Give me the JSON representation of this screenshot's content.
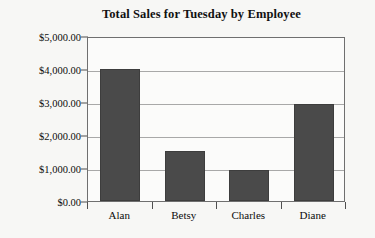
{
  "chart_data": {
    "type": "bar",
    "title": "Total Sales for Tuesday by Employee",
    "xlabel": "",
    "ylabel": "",
    "categories": [
      "Alan",
      "Betsy",
      "Charles",
      "Diane"
    ],
    "values": [
      4000,
      1520,
      950,
      2950
    ],
    "ylim": [
      0,
      5000
    ],
    "ytick_values": [
      0,
      1000,
      2000,
      3000,
      4000,
      5000
    ],
    "ytick_labels": [
      "$0.00",
      "$1,000.00",
      "$2,000.00",
      "$3,000.00",
      "$4,000.00",
      "$5,000.00"
    ],
    "grid": true,
    "legend": false,
    "bar_color": "#4a4a4a",
    "plot_background": "#fbfbfa",
    "gridline_color": "#a8a8a8",
    "axis_color": "#6f6f6f",
    "page_background": "#f7f7f5"
  }
}
